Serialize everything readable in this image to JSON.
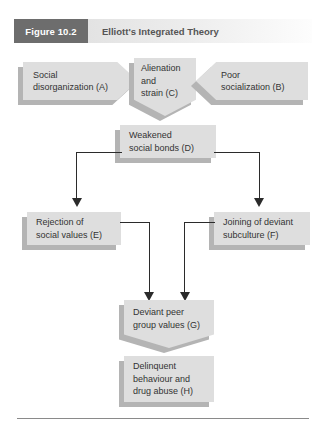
{
  "figure": {
    "tag": "Figure 10.2",
    "title": "Elliott's Integrated Theory"
  },
  "colors": {
    "tag_background": "#6d6d6d",
    "title_background": "#ededed",
    "node_fill": "#dedede",
    "node_shadow": "#b4b4b4",
    "connector": "#2b2b2b",
    "text": "#333333",
    "rule": "#8a8a8a"
  },
  "nodes": {
    "a": {
      "id": "A",
      "line1": "Social",
      "line2": "disorganization (A)",
      "shape": "arrow-right"
    },
    "c": {
      "id": "C",
      "line1": "Alienation",
      "line2": "and",
      "line3": "strain (C)",
      "shape": "arrow-down"
    },
    "b": {
      "id": "B",
      "line1": "Poor",
      "line2": "socialization (B)",
      "shape": "arrow-left"
    },
    "d": {
      "id": "D",
      "line1": "Weakened",
      "line2": "social bonds (D)",
      "shape": "rectangle"
    },
    "e": {
      "id": "E",
      "line1": "Rejection of",
      "line2": "social values (E)",
      "shape": "rectangle"
    },
    "f": {
      "id": "F",
      "line1": "Joining of deviant",
      "line2": "subculture (F)",
      "shape": "rectangle"
    },
    "g": {
      "id": "G",
      "line1": "Deviant peer",
      "line2": "group values (G)",
      "shape": "arrow-down"
    },
    "h": {
      "id": "H",
      "line1": "Delinquent",
      "line2": "behaviour and",
      "line3": "drug abuse (H)",
      "shape": "rectangle"
    }
  },
  "connections": [
    {
      "from": "A",
      "to": "C",
      "style": "arrow-shape"
    },
    {
      "from": "B",
      "to": "C",
      "style": "arrow-shape"
    },
    {
      "from": "C",
      "to": "D",
      "style": "arrow-shape"
    },
    {
      "from": "D",
      "to": "E",
      "style": "elbow-arrow"
    },
    {
      "from": "D",
      "to": "F",
      "style": "elbow-arrow"
    },
    {
      "from": "E",
      "to": "G",
      "style": "elbow-arrow"
    },
    {
      "from": "F",
      "to": "G",
      "style": "elbow-arrow"
    },
    {
      "from": "G",
      "to": "H",
      "style": "arrow-shape"
    }
  ]
}
